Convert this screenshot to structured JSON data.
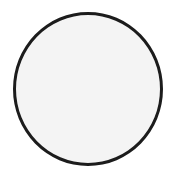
{
  "shape": {
    "type": "circle",
    "stroke_color": "#1c1c1c",
    "fill_color": "#f4f4f4",
    "background_color": "#ffffff"
  }
}
